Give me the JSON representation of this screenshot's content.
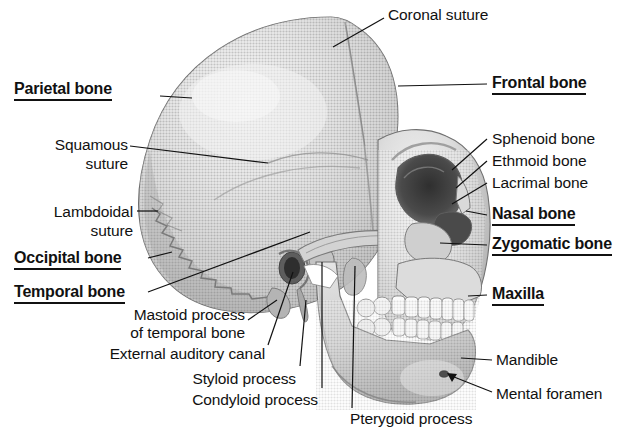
{
  "figure": {
    "style": "grayscale halftone anatomical illustration",
    "width": 627,
    "height": 441,
    "background_color": "#ffffff",
    "text_color": "#111111",
    "bone_color": "#c9c9c9",
    "bone_shadow_color": "#8e8e8e",
    "bone_highlight_color": "#ececec",
    "tooth_color": "#fbfbfb",
    "cavity_color": "#3d3d3d"
  },
  "labels": [
    {
      "id": "coronal-suture",
      "text": "Coronal suture",
      "emphasis": "plain",
      "lines": [
        "Coronal suture"
      ],
      "align": "left",
      "x": 388,
      "y": 6,
      "anchor_x": 333,
      "anchor_y": 45
    },
    {
      "id": "frontal-bone",
      "text": "Frontal bone",
      "emphasis": "bold",
      "lines": [
        "Frontal bone"
      ],
      "align": "left",
      "x": 492,
      "y": 74,
      "anchor_x": 398,
      "anchor_y": 86
    },
    {
      "id": "parietal-bone",
      "text": "Parietal bone",
      "emphasis": "bold",
      "lines": [
        "Parietal bone"
      ],
      "align": "left",
      "x": 14,
      "y": 80,
      "anchor_x": 192,
      "anchor_y": 98
    },
    {
      "id": "squamous-suture",
      "text": "Squamous suture",
      "emphasis": "plain",
      "lines": [
        "Squamous",
        "suture"
      ],
      "align": "right",
      "x": 38,
      "y": 138,
      "anchor_x": 268,
      "anchor_y": 163
    },
    {
      "id": "lambdoidal-suture",
      "text": "Lambdoidal suture",
      "emphasis": "plain",
      "lines": [
        "Lambdoidal",
        "suture"
      ],
      "align": "right",
      "x": 34,
      "y": 205,
      "anchor_x": 155,
      "anchor_y": 212
    },
    {
      "id": "occipital-bone",
      "text": "Occipital bone",
      "emphasis": "bold",
      "lines": [
        "Occipital bone"
      ],
      "align": "left",
      "x": 14,
      "y": 250,
      "anchor_x": 168,
      "anchor_y": 257
    },
    {
      "id": "temporal-bone",
      "text": "Temporal bone",
      "emphasis": "bold",
      "lines": [
        "Temporal bone"
      ],
      "align": "left",
      "x": 14,
      "y": 285,
      "anchor_x": 300,
      "anchor_y": 240
    },
    {
      "id": "sphenoid-bone",
      "text": "Sphenoid bone",
      "emphasis": "plain",
      "lines": [
        "Sphenoid bone"
      ],
      "align": "left",
      "x": 492,
      "y": 131,
      "anchor_x": 446,
      "anchor_y": 168
    },
    {
      "id": "ethmoid-bone",
      "text": "Ethmoid bone",
      "emphasis": "plain",
      "lines": [
        "Ethmoid bone"
      ],
      "align": "left",
      "x": 492,
      "y": 154,
      "anchor_x": 452,
      "anchor_y": 186
    },
    {
      "id": "lacrimal-bone",
      "text": "Lacrimal bone",
      "emphasis": "plain",
      "lines": [
        "Lacrimal bone"
      ],
      "align": "left",
      "x": 492,
      "y": 176,
      "anchor_x": 456,
      "anchor_y": 198
    },
    {
      "id": "nasal-bone",
      "text": "Nasal bone",
      "emphasis": "bold",
      "lines": [
        "Nasal bone"
      ],
      "align": "left",
      "x": 492,
      "y": 207,
      "anchor_x": 468,
      "anchor_y": 212
    },
    {
      "id": "zygomatic-bone",
      "text": "Zygomatic bone",
      "emphasis": "bold",
      "lines": [
        "Zygomatic bone"
      ],
      "align": "left",
      "x": 492,
      "y": 237,
      "anchor_x": 443,
      "anchor_y": 243
    },
    {
      "id": "maxilla",
      "text": "Maxilla",
      "emphasis": "bold",
      "lines": [
        "Maxilla"
      ],
      "align": "left",
      "x": 492,
      "y": 287,
      "anchor_x": 470,
      "anchor_y": 293
    },
    {
      "id": "mandible",
      "text": "Mandible",
      "emphasis": "plain",
      "lines": [
        "Mandible"
      ],
      "align": "left",
      "x": 496,
      "y": 353,
      "anchor_x": 461,
      "anchor_y": 360
    },
    {
      "id": "mental-foramen",
      "text": "Mental foramen",
      "emphasis": "plain",
      "lines": [
        "Mental foramen"
      ],
      "align": "left",
      "x": 496,
      "y": 388,
      "anchor_x": 446,
      "anchor_y": 377
    },
    {
      "id": "mastoid-process",
      "text": "Mastoid process of temporal bone",
      "emphasis": "plain",
      "lines": [
        "Mastoid process",
        "of temporal bone"
      ],
      "align": "right",
      "x": 110,
      "y": 308,
      "anchor_x": 276,
      "anchor_y": 300
    },
    {
      "id": "external-auditory-canal",
      "text": "External auditory canal",
      "emphasis": "plain",
      "lines": [
        "External auditory canal"
      ],
      "align": "right",
      "x": 96,
      "y": 348,
      "anchor_x": 291,
      "anchor_y": 268
    },
    {
      "id": "styloid-process",
      "text": "Styloid process",
      "emphasis": "plain",
      "lines": [
        "Styloid process"
      ],
      "align": "right",
      "x": 182,
      "y": 372,
      "anchor_x": 306,
      "anchor_y": 295
    },
    {
      "id": "condyloid-process",
      "text": "Condyloid process",
      "emphasis": "plain",
      "lines": [
        "Condyloid process"
      ],
      "align": "right",
      "x": 170,
      "y": 393,
      "anchor_x": 322,
      "anchor_y": 255
    },
    {
      "id": "pterygoid-process",
      "text": "Pterygoid process",
      "emphasis": "plain",
      "lines": [
        "Pterygoid process"
      ],
      "align": "left",
      "x": 350,
      "y": 414,
      "anchor_x": 358,
      "anchor_y": 262
    }
  ],
  "anatomy_parts": [
    "cranial vault",
    "frontal bone",
    "parietal bone",
    "occipital bone",
    "temporal bone",
    "coronal suture",
    "squamous suture",
    "lambdoidal suture",
    "orbit",
    "nasal aperture",
    "zygomatic arch",
    "maxilla with upper teeth",
    "mandible with lower teeth",
    "mastoid process",
    "external auditory canal",
    "styloid process",
    "condyloid process",
    "mental foramen",
    "pterygoid process"
  ]
}
